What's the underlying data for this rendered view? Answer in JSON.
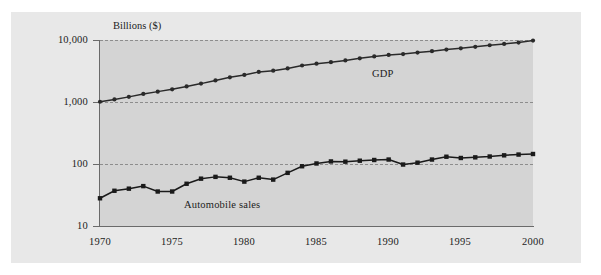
{
  "chart_data": {
    "type": "line",
    "title": "",
    "subtitle": "",
    "axis_title": "Billions ($)",
    "xlabel": "",
    "ylabel": "Billions ($)",
    "yscale": "log",
    "ylim": [
      10,
      10000
    ],
    "xlim": [
      1970,
      2000
    ],
    "grid": true,
    "legend_position": "inline-annotation",
    "y_ticks": [
      {
        "value": 10000,
        "label": "10,000"
      },
      {
        "value": 1000,
        "label": "1,000"
      },
      {
        "value": 100,
        "label": "100"
      },
      {
        "value": 10,
        "label": "10"
      }
    ],
    "x_ticks": [
      {
        "value": 1970,
        "label": "1970"
      },
      {
        "value": 1975,
        "label": "1975"
      },
      {
        "value": 1980,
        "label": "1980"
      },
      {
        "value": 1985,
        "label": "1985"
      },
      {
        "value": 1990,
        "label": "1990"
      },
      {
        "value": 1995,
        "label": "1995"
      },
      {
        "value": 2000,
        "label": "2000"
      }
    ],
    "x": [
      1970,
      1971,
      1972,
      1973,
      1974,
      1975,
      1976,
      1977,
      1978,
      1979,
      1980,
      1981,
      1982,
      1983,
      1984,
      1985,
      1986,
      1987,
      1988,
      1989,
      1990,
      1991,
      1992,
      1993,
      1994,
      1995,
      1996,
      1997,
      1998,
      1999,
      2000
    ],
    "series": [
      {
        "name": "GDP",
        "label": "GDP",
        "color": "#2a2a2a",
        "marker": "circle",
        "values": [
          1010,
          1100,
          1210,
          1350,
          1470,
          1600,
          1780,
          1980,
          2230,
          2500,
          2730,
          3060,
          3200,
          3480,
          3880,
          4150,
          4390,
          4680,
          5060,
          5440,
          5750,
          5940,
          6270,
          6600,
          7000,
          7350,
          7770,
          8230,
          8650,
          9100,
          9800
        ]
      },
      {
        "name": "Automobile sales",
        "label": "Automobile sales",
        "color": "#1a1a1a",
        "marker": "square",
        "values": [
          28,
          37,
          40,
          44,
          36,
          36,
          48,
          58,
          62,
          60,
          52,
          60,
          56,
          72,
          92,
          102,
          110,
          109,
          113,
          116,
          118,
          98,
          105,
          118,
          131,
          125,
          128,
          132,
          138,
          142,
          145
        ]
      }
    ]
  },
  "annotations": [
    {
      "name": "gdp-label",
      "text": "GDP"
    },
    {
      "name": "automobile-sales-label",
      "text": "Automobile sales"
    }
  ]
}
